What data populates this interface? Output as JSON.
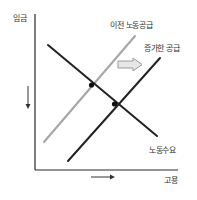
{
  "diagram": {
    "axes": {
      "y_label": "임금",
      "x_label": "고용",
      "y_shift_direction": "down",
      "x_shift_direction": "right"
    },
    "curves": [
      {
        "id": "old_supply",
        "label": "이전 노동공급",
        "color": "#a8a8a8",
        "kind": "supply"
      },
      {
        "id": "new_supply",
        "label": "증가한 공급",
        "color": "#222222",
        "kind": "supply"
      },
      {
        "id": "demand",
        "label": "노동수요",
        "color": "#222222",
        "kind": "demand"
      }
    ],
    "shift_arrow": {
      "direction": "right",
      "color": "#b5b5b5"
    },
    "equilibria": [
      {
        "name": "original",
        "curves": [
          "old_supply",
          "demand"
        ]
      },
      {
        "name": "new",
        "curves": [
          "new_supply",
          "demand"
        ]
      }
    ]
  },
  "colors": {
    "axis": "#2a2a2a",
    "dark_line": "#222222",
    "light_line": "#a8a8a8",
    "arrow_fill": "#e6e6e6",
    "arrow_stroke": "#9a9a9a"
  }
}
